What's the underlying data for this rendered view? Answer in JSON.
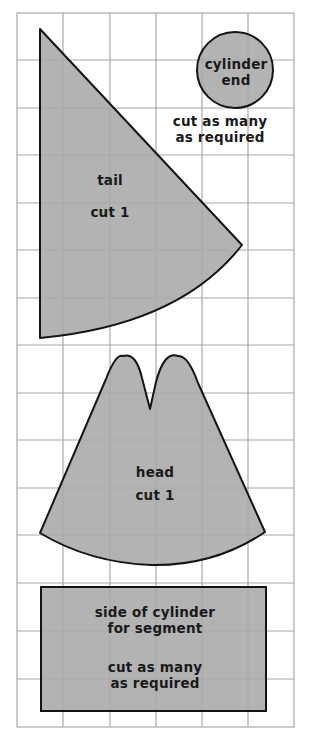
{
  "diagram": {
    "type": "sewing pattern pieces on grid",
    "colors": {
      "background": "#ffffff",
      "grid_line": "#a8a8a8",
      "piece_fill": "#a9a9a9",
      "piece_outline": "#141414",
      "text": "#1a1a1a"
    },
    "grid": {
      "columns": 6,
      "rows": 15
    },
    "pieces": {
      "cylinder_end": {
        "name": "cylinder end",
        "line1": "cylinder",
        "line2": "end",
        "instruction_line1": "cut as many",
        "instruction_line2": "as required"
      },
      "tail": {
        "name": "tail",
        "instruction": "cut 1"
      },
      "head": {
        "name": "head",
        "instruction": "cut 1"
      },
      "cylinder_side": {
        "line1": "side of cylinder",
        "line2": "for segment",
        "instruction_line1": "cut as many",
        "instruction_line2": "as required"
      }
    }
  }
}
